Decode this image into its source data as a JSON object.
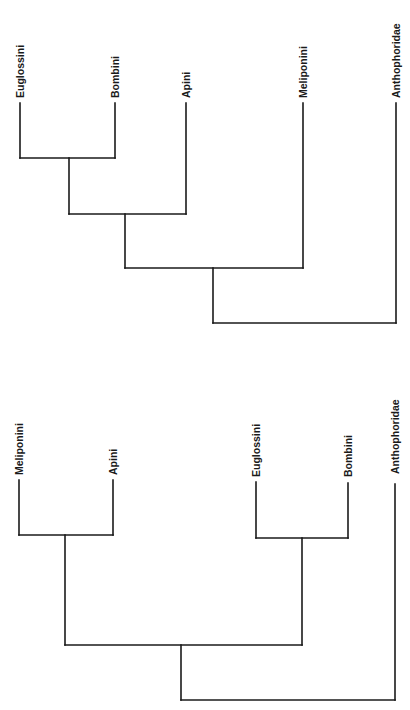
{
  "figure": {
    "background": "#ffffff",
    "line_color": "#1a1a1a",
    "orientation": "rotated-90-ccw"
  },
  "cladograms": [
    {
      "id": "top",
      "newick": "((((Euglossini,Bombini),Apini),Meliponini),Anthophoridae)",
      "leaves": [
        {
          "label": "Euglossini",
          "x": 20,
          "tip_y": 103
        },
        {
          "label": "Bombini",
          "x": 115,
          "tip_y": 103
        },
        {
          "label": "Apini",
          "x": 186,
          "tip_y": 103
        },
        {
          "label": "Meliponini",
          "x": 303,
          "tip_y": 103
        },
        {
          "label": "Anthophoridae",
          "x": 396,
          "tip_y": 103
        }
      ],
      "nodes": [
        {
          "name": "Euglossini+Bombini",
          "x1": 20,
          "x2": 115,
          "y": 158,
          "mid": 69
        },
        {
          "name": "corbiculate-3",
          "x1": 69,
          "x2": 186,
          "y": 214,
          "mid": 125
        },
        {
          "name": "corbiculate-4",
          "x1": 125,
          "x2": 303,
          "y": 268,
          "mid": 213
        },
        {
          "name": "root",
          "x1": 213,
          "x2": 396,
          "y": 323,
          "mid": null
        }
      ]
    },
    {
      "id": "bottom",
      "newick": "(((Meliponini,Apini),(Euglossini,Bombini)),Anthophoridae)",
      "leaves": [
        {
          "label": "Meliponini",
          "x": 19,
          "tip_y": 480
        },
        {
          "label": "Apini",
          "x": 113,
          "tip_y": 480
        },
        {
          "label": "Euglossini",
          "x": 256,
          "tip_y": 482
        },
        {
          "label": "Bombini",
          "x": 348,
          "tip_y": 483
        },
        {
          "label": "Anthophoridae",
          "x": 395,
          "tip_y": 484
        }
      ],
      "nodes": [
        {
          "name": "Meliponini+Apini",
          "x1": 19,
          "x2": 113,
          "y": 535,
          "mid": 65
        },
        {
          "name": "Euglossini+Bombini",
          "x1": 256,
          "x2": 348,
          "y": 538,
          "mid": 302
        },
        {
          "name": "corbiculate",
          "x1": 65,
          "x2": 302,
          "y": 645,
          "mid": 181
        },
        {
          "name": "root",
          "x1": 181,
          "x2": 395,
          "y": 700,
          "mid": null
        }
      ]
    }
  ]
}
